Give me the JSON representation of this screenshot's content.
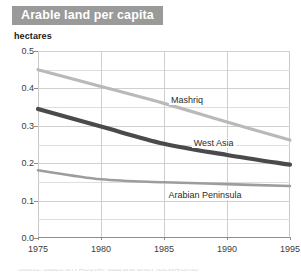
{
  "figure": {
    "title": "Arable land per capita",
    "title_bg": "#9a9a9a",
    "title_color": "#ffffff",
    "y_unit_label": "hectares",
    "footer_partial": "Source: based on FAOSTAT data and UNEP/DEWA/GRID"
  },
  "chart_data": {
    "type": "line",
    "title": "Arable land per capita",
    "xlabel": "",
    "ylabel": "hectares",
    "xlim": [
      1975,
      1995
    ],
    "ylim": [
      0.0,
      0.5
    ],
    "grid": true,
    "legend": "inline-labels",
    "yticks": [
      "0.5",
      "0.4",
      "0.3",
      "0.2",
      "0.1",
      "0.0"
    ],
    "ytick_values": [
      0.5,
      0.4,
      0.3,
      0.2,
      0.1,
      0.0
    ],
    "yminor_values": [
      0.45,
      0.35,
      0.25,
      0.15,
      0.05
    ],
    "xticks": [
      "1975",
      "1980",
      "1985",
      "1990",
      "1995"
    ],
    "xtick_values": [
      1975,
      1980,
      1985,
      1990,
      1995
    ],
    "x": [
      1975,
      1980,
      1985,
      1990,
      1995
    ],
    "series": [
      {
        "name": "Mashriq",
        "color": "#b9b9b9",
        "width": 3.2,
        "values": [
          0.45,
          0.405,
          0.36,
          0.31,
          0.262
        ],
        "label_x": 1985.4,
        "label_y": 0.368
      },
      {
        "name": "West Asia",
        "color": "#4a4a4a",
        "width": 4.2,
        "values": [
          0.345,
          0.298,
          0.252,
          0.222,
          0.196
        ],
        "label_x": 1987.2,
        "label_y": 0.253
      },
      {
        "name": "Arabian Peninsula",
        "color": "#9d9d9d",
        "width": 2.6,
        "values": [
          0.181,
          0.157,
          0.149,
          0.144,
          0.139
        ],
        "label_x": 1985.2,
        "label_y": 0.116
      }
    ]
  }
}
